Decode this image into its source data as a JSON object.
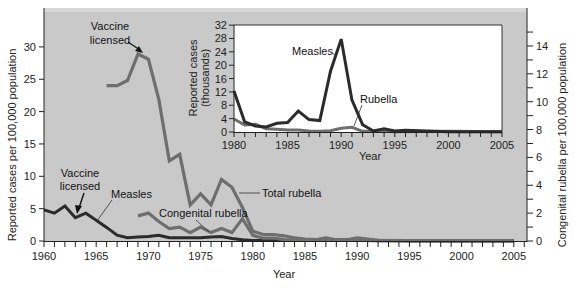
{
  "chart_data": [
    {
      "id": "main",
      "type": "line",
      "title": "",
      "xlabel": "Year",
      "ylabel": "Reported cases per 100,000 population",
      "y2label": "Congenital rubella per 100,000 population",
      "xlim": [
        1960,
        2006
      ],
      "ylim": [
        0,
        32
      ],
      "y2lim": [
        0,
        15
      ],
      "grid": false,
      "x_ticks": [
        1960,
        1965,
        1970,
        1975,
        1980,
        1985,
        1990,
        1995,
        2000,
        2005
      ],
      "y_ticks": [
        0,
        5,
        10,
        15,
        20,
        25,
        30
      ],
      "y2_ticks": [
        0,
        2,
        4,
        6,
        8,
        10,
        12,
        14
      ],
      "series": [
        {
          "name": "Measles",
          "axis": "left",
          "color": "#2b2b2b",
          "x": [
            1960,
            1961,
            1962,
            1963,
            1964,
            1965,
            1966,
            1967,
            1968,
            1969,
            1970,
            1971,
            1972,
            1973,
            1974,
            1975,
            1976,
            1977,
            1978,
            1979,
            1980,
            1981,
            1982,
            1983,
            1984,
            1985,
            1986,
            1987,
            1988,
            1989,
            1990,
            1991,
            1992,
            1993,
            1994,
            1995,
            2000,
            2005
          ],
          "values": [
            4.8,
            4.3,
            5.4,
            3.6,
            4.3,
            3.2,
            2.1,
            0.9,
            0.5,
            0.6,
            0.7,
            0.9,
            0.5,
            0.5,
            0.5,
            0.5,
            0.6,
            0.7,
            0.4,
            0.2,
            0.1,
            0.1,
            0.1,
            0.1,
            0.1,
            0.1,
            0.2,
            0.1,
            0.1,
            0.2,
            0.3,
            0.1,
            0.05,
            0.03,
            0.03,
            0.02,
            0.01,
            0.01
          ]
        },
        {
          "name": "Total rubella",
          "axis": "left",
          "color": "#6e6e6e",
          "x": [
            1966,
            1967,
            1968,
            1969,
            1970,
            1971,
            1972,
            1973,
            1974,
            1975,
            1976,
            1977,
            1978,
            1979,
            1980,
            1981,
            1982,
            1983,
            1984,
            1985,
            1986,
            1987,
            1988,
            1989,
            1990,
            1991,
            1992,
            1995,
            2000,
            2005
          ],
          "values": [
            24.0,
            24.0,
            24.8,
            28.9,
            28.1,
            21.9,
            12.4,
            13.4,
            5.6,
            7.3,
            5.6,
            9.5,
            8.3,
            5.2,
            1.5,
            1.0,
            1.0,
            0.8,
            0.5,
            0.3,
            0.2,
            0.5,
            0.2,
            0.2,
            0.5,
            0.3,
            0.1,
            0.05,
            0.02,
            0.01
          ]
        },
        {
          "name": "Congenital rubella",
          "axis": "right",
          "color": "#6e6e6e",
          "x": [
            1969,
            1970,
            1971,
            1972,
            1973,
            1974,
            1975,
            1976,
            1977,
            1978,
            1979,
            1980,
            1981,
            1982,
            1983,
            1985,
            1990,
            1995,
            2000,
            2005
          ],
          "values": [
            1.8,
            2.0,
            1.4,
            0.9,
            1.0,
            0.6,
            1.0,
            0.6,
            0.9,
            0.6,
            1.6,
            0.4,
            0.2,
            0.2,
            0.1,
            0.05,
            0.05,
            0.02,
            0.01,
            0.01
          ]
        }
      ],
      "annotations": [
        {
          "text": "Vaccine licensed",
          "target_series": "Total rubella",
          "target_x": 1969
        },
        {
          "text": "Vaccine licensed",
          "target_series": "Measles",
          "target_x": 1963
        },
        {
          "text": "Measles",
          "target_series": "Measles"
        },
        {
          "text": "Total rubella",
          "target_series": "Total rubella"
        },
        {
          "text": "Congenital rubella",
          "target_series": "Congenital rubella"
        }
      ]
    },
    {
      "id": "inset",
      "type": "line",
      "title": "",
      "xlabel": "Year",
      "ylabel": "Reported cases (thousands)",
      "xlim": [
        1980,
        2005
      ],
      "ylim": [
        0,
        32
      ],
      "grid": false,
      "x_ticks": [
        1980,
        1985,
        1990,
        1995,
        2000,
        2005
      ],
      "y_ticks": [
        0,
        4,
        8,
        12,
        16,
        20,
        24,
        28,
        32
      ],
      "series": [
        {
          "name": "Measles",
          "color": "#2b2b2b",
          "x": [
            1980,
            1981,
            1982,
            1983,
            1984,
            1985,
            1986,
            1987,
            1988,
            1989,
            1990,
            1991,
            1992,
            1993,
            1994,
            1995,
            1996,
            2000,
            2005
          ],
          "values": [
            12.3,
            3.0,
            1.8,
            1.5,
            2.6,
            2.8,
            6.3,
            3.7,
            3.4,
            18.2,
            27.8,
            9.6,
            2.2,
            0.3,
            1.0,
            0.3,
            0.5,
            0.1,
            0.1
          ]
        },
        {
          "name": "Rubella",
          "color": "#6e6e6e",
          "x": [
            1980,
            1981,
            1982,
            1983,
            1984,
            1985,
            1986,
            1987,
            1988,
            1989,
            1990,
            1991,
            1992,
            1993,
            1994,
            1995,
            2000,
            2005
          ],
          "values": [
            3.9,
            2.1,
            2.3,
            1.0,
            0.8,
            0.6,
            0.6,
            0.3,
            0.2,
            0.4,
            1.1,
            1.4,
            0.2,
            0.2,
            0.2,
            0.1,
            0.2,
            0.05
          ]
        }
      ],
      "annotations": [
        {
          "text": "Measles",
          "target_series": "Measles"
        },
        {
          "text": "Rubella",
          "target_series": "Rubella"
        }
      ]
    }
  ],
  "labels": {
    "main_xlabel": "Year",
    "main_ylabel": "Reported cases per 100,000 population",
    "main_y2label": "Congenital rubella per 100,000 population",
    "inset_xlabel": "Year",
    "inset_ylabel_line1": "Reported cases",
    "inset_ylabel_line2": "(thousands)",
    "annot_vaccine_1_line1": "Vaccine",
    "annot_vaccine_1_line2": "licensed",
    "annot_vaccine_2_line1": "Vaccine",
    "annot_vaccine_2_line2": "licensed",
    "annot_measles": "Measles",
    "annot_total_rubella": "Total rubella",
    "annot_congenital_rubella": "Congenital rubella",
    "inset_annot_measles": "Measles",
    "inset_annot_rubella": "Rubella"
  },
  "colors": {
    "panel_bg": "#c9c9c9",
    "inset_bg": "#ffffff",
    "measles_line": "#2b2b2b",
    "rubella_line": "#6e6e6e",
    "axis": "#222222"
  }
}
